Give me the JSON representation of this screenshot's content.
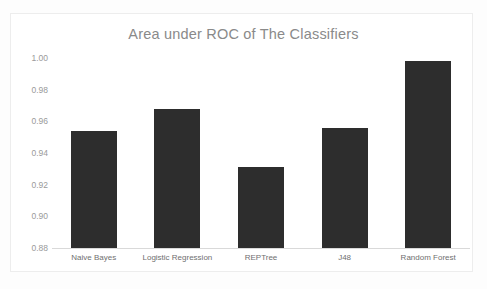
{
  "chart_data": {
    "type": "bar",
    "title": "Area under ROC of The Classifiers",
    "xlabel": "",
    "ylabel": "",
    "categories": [
      "Naive Bayes",
      "Logistic Regression",
      "REPTree",
      "J48",
      "Random Forest"
    ],
    "values": [
      0.954,
      0.968,
      0.931,
      0.956,
      0.998
    ],
    "ylim": [
      0.88,
      1.0
    ],
    "yticks": [
      "1.00",
      "0.98",
      "0.96",
      "0.94",
      "0.92",
      "0.90",
      "0.88"
    ],
    "ytick_values": [
      1.0,
      0.98,
      0.96,
      0.94,
      0.92,
      0.9,
      0.88
    ],
    "grid": false,
    "legend": false,
    "series": [
      {
        "name": "Area under ROC",
        "values": [
          0.954,
          0.968,
          0.931,
          0.956,
          0.998
        ]
      }
    ],
    "colors": {
      "bar": "#2d2d2d",
      "title": "#8a8a8a",
      "tick_label": "#9a9a9a",
      "category_label": "#6f6f6f",
      "axis_line": "#d9d9d9",
      "background": "#ffffff"
    }
  }
}
